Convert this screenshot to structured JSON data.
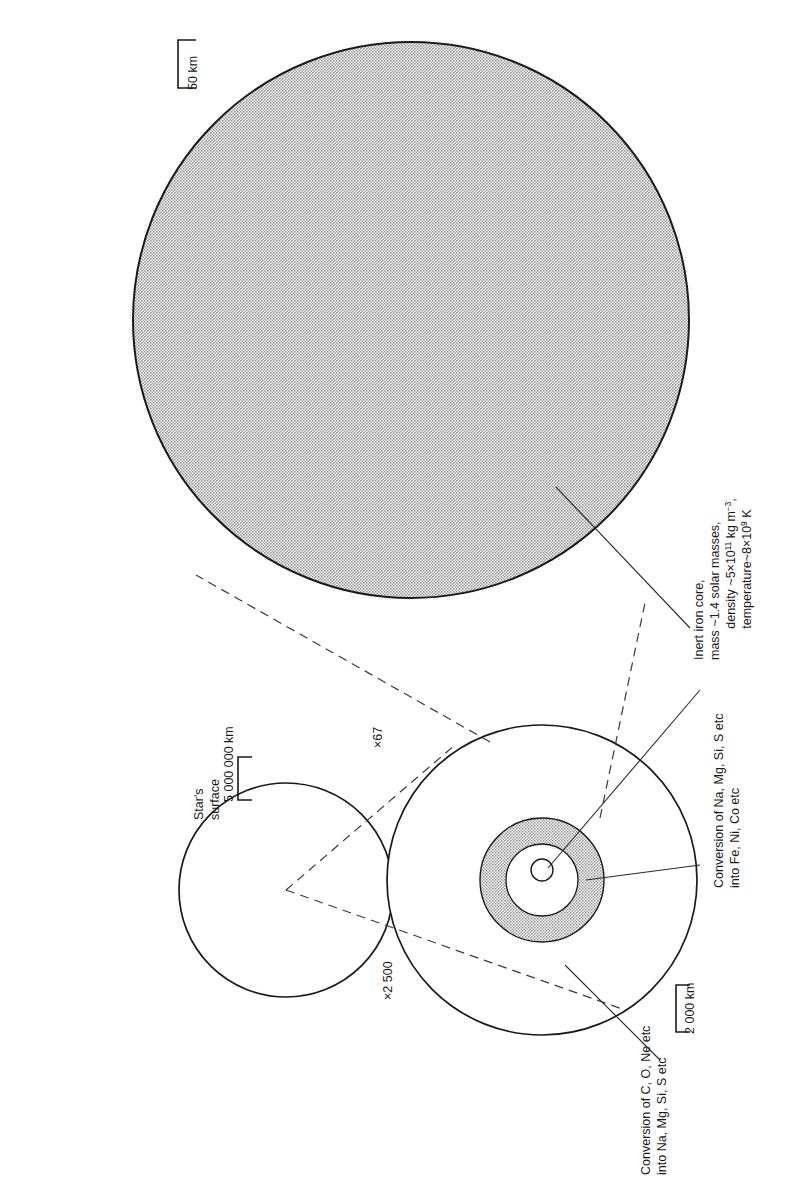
{
  "figure": {
    "orientation": "rotated-90-ccw",
    "background_color": "#ffffff",
    "ink_color": "#1a1a1a",
    "core_fill_color": "#b3b3b3"
  },
  "scales": [
    {
      "id": "scale-top",
      "label": "50 km",
      "applies_to": "iron-core-magnified"
    },
    {
      "id": "scale-star",
      "label": "5 000 000 km",
      "applies_to": "star-surface"
    },
    {
      "id": "scale-inner",
      "label": "2 000 km",
      "applies_to": "burning-shells"
    }
  ],
  "magnifications": [
    {
      "id": "mag-star-to-shells",
      "label": "×2 500"
    },
    {
      "id": "mag-shells-to-core",
      "label": "×67"
    }
  ],
  "annotations": {
    "star_surface": {
      "lines": [
        "Star's",
        "surface"
      ]
    },
    "iron_core": {
      "lines": [
        "Inert iron core,",
        "mass ~1.4 solar masses,",
        "density ~5×10¹¹ kg m⁻³,",
        "temperature~8×10⁹ K"
      ],
      "parts": {
        "l1": "Inert iron core,",
        "l2": "mass ~1.4 solar masses,",
        "l3_a": "density ~5×10",
        "l3_sup": "11",
        "l3_b": " kg m",
        "l3_sup2": "−3",
        "l3_c": ",",
        "l4_a": "temperature~8×10",
        "l4_sup": "9",
        "l4_b": " K"
      }
    },
    "silicon_shell": {
      "lines": [
        "Conversion of Na, Mg, Si, S etc",
        "into Fe, Ni, Co etc"
      ]
    },
    "carbon_shell": {
      "lines": [
        "Conversion of C, O, Ne etc",
        "into Na, Mg, Si, S etc"
      ]
    }
  }
}
